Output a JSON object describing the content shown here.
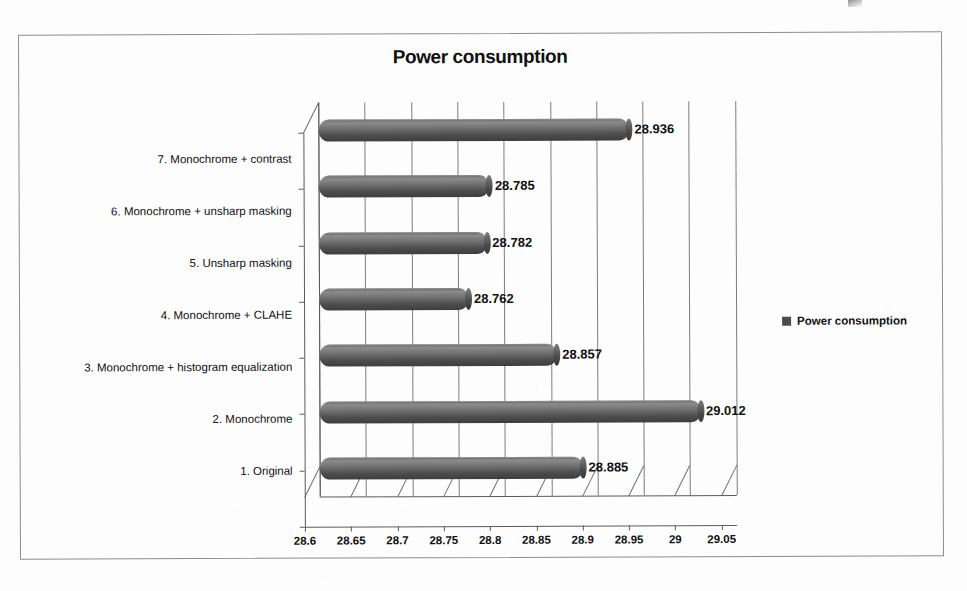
{
  "chart_data": {
    "type": "bar",
    "orientation": "horizontal",
    "title": "Power consumption",
    "xlabel": "",
    "ylabel": "",
    "xlim": [
      28.6,
      29.05
    ],
    "xticks": [
      "28.6",
      "28.65",
      "28.7",
      "28.75",
      "28.8",
      "28.85",
      "28.9",
      "28.95",
      "29",
      "29.05"
    ],
    "xtick_values": [
      28.6,
      28.65,
      28.7,
      28.75,
      28.8,
      28.85,
      28.9,
      28.95,
      29,
      29.05
    ],
    "grid": true,
    "legend": {
      "position": "right",
      "entries": [
        "Power consumption"
      ]
    },
    "series": [
      {
        "name": "Power consumption",
        "color": "#4c4c4c",
        "categories": [
          "1. Original",
          "2. Monochrome",
          "3. Monochrome + histogram equalization",
          "4. Monochrome + CLAHE",
          "5. Unsharp masking",
          "6. Monochrome + unsharp masking",
          "7. Monochrome + contrast"
        ],
        "values": [
          28.885,
          29.012,
          28.857,
          28.762,
          28.782,
          28.785,
          28.936
        ],
        "data_labels": [
          "28.885",
          "29.012",
          "28.857",
          "28.762",
          "28.782",
          "28.785",
          "28.936"
        ]
      }
    ],
    "bars_top_to_bottom": [
      {
        "category": "7. Monochrome + contrast",
        "value": 28.936,
        "label": "28.936"
      },
      {
        "category": "6. Monochrome + unsharp masking",
        "value": 28.785,
        "label": "28.785"
      },
      {
        "category": "5. Unsharp masking",
        "value": 28.782,
        "label": "28.782"
      },
      {
        "category": "4. Monochrome + CLAHE",
        "value": 28.762,
        "label": "28.762"
      },
      {
        "category": "3. Monochrome + histogram equalization",
        "value": 28.857,
        "label": "28.857"
      },
      {
        "category": "2. Monochrome",
        "value": 29.012,
        "label": "29.012"
      },
      {
        "category": "1. Original",
        "value": 28.885,
        "label": "28.885"
      }
    ]
  },
  "legend": {
    "label": "Power consumption"
  }
}
